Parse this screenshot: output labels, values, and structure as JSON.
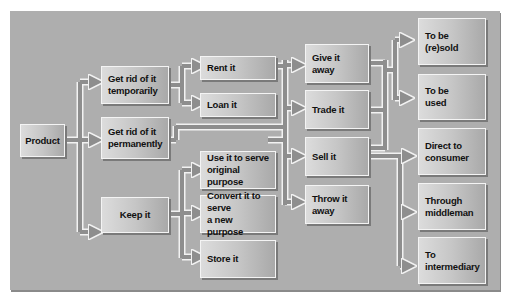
{
  "diagram": {
    "title": "",
    "colors": {
      "panel": "#aeaeae",
      "connector": "#8e8e8e",
      "connector_edge": "#f2f2f2",
      "box_light": "#dcdcdc",
      "box_dark": "#a9a9a9"
    },
    "nodes": {
      "product": "Product",
      "get_rid_temporarily": "Get rid of it\ntemporarily",
      "get_rid_permanently": "Get rid of it\npermanently",
      "keep_it": "Keep it",
      "rent_it": "Rent it",
      "loan_it": "Loan it",
      "use_original": "Use it to serve\noriginal purpose",
      "convert_new": "Convert it to serve\na new purpose",
      "store_it": "Store it",
      "give_away": "Give it away",
      "trade_it": "Trade it",
      "sell_it": "Sell it",
      "throw_away": "Throw it away",
      "to_be_resold": "To be\n(re)sold",
      "to_be_used": "To be\nused",
      "direct_consumer": "Direct to\nconsumer",
      "through_middleman": "Through\nmiddleman",
      "to_intermediary": "To\nintermediary"
    },
    "edges": [
      [
        "product",
        "get_rid_temporarily"
      ],
      [
        "product",
        "get_rid_permanently"
      ],
      [
        "product",
        "keep_it"
      ],
      [
        "get_rid_temporarily",
        "rent_it"
      ],
      [
        "get_rid_temporarily",
        "loan_it"
      ],
      [
        "rent_it",
        "give_away"
      ],
      [
        "rent_it",
        "trade_it"
      ],
      [
        "rent_it",
        "sell_it"
      ],
      [
        "get_rid_permanently",
        "give_away"
      ],
      [
        "get_rid_permanently",
        "trade_it"
      ],
      [
        "get_rid_permanently",
        "sell_it"
      ],
      [
        "get_rid_permanently",
        "throw_away"
      ],
      [
        "keep_it",
        "use_original"
      ],
      [
        "keep_it",
        "convert_new"
      ],
      [
        "keep_it",
        "store_it"
      ],
      [
        "give_away",
        "to_be_resold"
      ],
      [
        "give_away",
        "to_be_used"
      ],
      [
        "trade_it",
        "to_be_resold"
      ],
      [
        "trade_it",
        "to_be_used"
      ],
      [
        "sell_it",
        "to_be_resold"
      ],
      [
        "sell_it",
        "to_be_used"
      ],
      [
        "sell_it",
        "direct_consumer"
      ],
      [
        "sell_it",
        "through_middleman"
      ],
      [
        "sell_it",
        "to_intermediary"
      ]
    ]
  }
}
